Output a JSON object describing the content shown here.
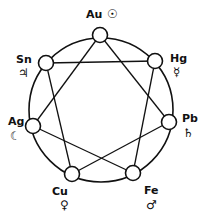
{
  "nodes": [
    {
      "id": "au",
      "element": "Au",
      "symbol": "☉",
      "x": 100,
      "y": 35
    },
    {
      "id": "hg",
      "element": "Hg",
      "symbol": "☿",
      "x": 155,
      "y": 61
    },
    {
      "id": "pb",
      "element": "Pb",
      "symbol": "♄",
      "x": 169,
      "y": 122
    },
    {
      "id": "fe",
      "element": "Fe",
      "symbol": "♂",
      "x": 133,
      "y": 173
    },
    {
      "id": "cu",
      "element": "Cu",
      "symbol": "♀",
      "x": 72,
      "y": 174
    },
    {
      "id": "ag",
      "element": "Ag",
      "symbol": "☾",
      "x": 33,
      "y": 126
    },
    {
      "id": "sn",
      "element": "Sn",
      "symbol": "♃",
      "x": 46,
      "y": 63
    }
  ],
  "edges": [
    [
      "au",
      "pb"
    ],
    [
      "au",
      "ag"
    ],
    [
      "sn",
      "hg"
    ],
    [
      "sn",
      "cu"
    ],
    [
      "hg",
      "fe"
    ],
    [
      "pb",
      "cu"
    ],
    [
      "ag",
      "fe"
    ]
  ],
  "colors": {
    "stroke": "#111111",
    "fill": "#ffffff"
  }
}
